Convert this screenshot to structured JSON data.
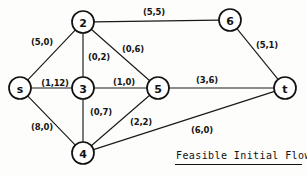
{
  "diagram": {
    "title": "Feasible Initial Flow",
    "caption": "Feasible Initial Flow",
    "nodes": [
      {
        "id": "s",
        "label": "s",
        "x": 20,
        "y": 88,
        "r": 11
      },
      {
        "id": "2",
        "label": "2",
        "x": 83,
        "y": 22,
        "r": 11
      },
      {
        "id": "3",
        "label": "3",
        "x": 83,
        "y": 88,
        "r": 11
      },
      {
        "id": "4",
        "label": "4",
        "x": 83,
        "y": 153,
        "r": 11
      },
      {
        "id": "5",
        "label": "5",
        "x": 158,
        "y": 88,
        "r": 11
      },
      {
        "id": "6",
        "label": "6",
        "x": 230,
        "y": 20,
        "r": 11
      },
      {
        "id": "t",
        "label": "t",
        "x": 285,
        "y": 88,
        "r": 11
      }
    ],
    "edges": [
      {
        "from": "s",
        "to": "2",
        "label": "(5,0)",
        "lx": 42,
        "ly": 42
      },
      {
        "from": "2",
        "to": "6",
        "label": "(5,5)",
        "lx": 154,
        "ly": 12
      },
      {
        "from": "2",
        "to": "3",
        "label": "(0,2)",
        "lx": 99,
        "ly": 57
      },
      {
        "from": "2",
        "to": "5",
        "label": "(0,6)",
        "lx": 133,
        "ly": 49
      },
      {
        "from": "6",
        "to": "t",
        "label": "(5,1)",
        "lx": 267,
        "ly": 45
      },
      {
        "from": "s",
        "to": "3",
        "label": "(1,12)",
        "lx": 55,
        "ly": 83
      },
      {
        "from": "3",
        "to": "5",
        "label": "(1,0)",
        "lx": 124,
        "ly": 82
      },
      {
        "from": "5",
        "to": "t",
        "label": "(3,6)",
        "lx": 207,
        "ly": 80
      },
      {
        "from": "3",
        "to": "4",
        "label": "(0,7)",
        "lx": 101,
        "ly": 112
      },
      {
        "from": "s",
        "to": "4",
        "label": "(8,0)",
        "lx": 42,
        "ly": 127
      },
      {
        "from": "4",
        "to": "5",
        "label": "(2,2)",
        "lx": 141,
        "ly": 122
      },
      {
        "from": "4",
        "to": "t",
        "label": "(6,0)",
        "lx": 202,
        "ly": 130
      }
    ]
  },
  "chart_data": {
    "type": "diagram",
    "title": "Feasible Initial Flow",
    "nodes": [
      "s",
      "2",
      "3",
      "4",
      "5",
      "6",
      "t"
    ],
    "edges": [
      {
        "from": "s",
        "to": "2",
        "flow": 5,
        "capacity": 0,
        "label": "(5,0)"
      },
      {
        "from": "s",
        "to": "3",
        "flow": 1,
        "capacity": 12,
        "label": "(1,12)"
      },
      {
        "from": "s",
        "to": "4",
        "flow": 8,
        "capacity": 0,
        "label": "(8,0)"
      },
      {
        "from": "2",
        "to": "6",
        "flow": 5,
        "capacity": 5,
        "label": "(5,5)"
      },
      {
        "from": "2",
        "to": "3",
        "flow": 0,
        "capacity": 2,
        "label": "(0,2)"
      },
      {
        "from": "2",
        "to": "5",
        "flow": 0,
        "capacity": 6,
        "label": "(0,6)"
      },
      {
        "from": "3",
        "to": "5",
        "flow": 1,
        "capacity": 0,
        "label": "(1,0)"
      },
      {
        "from": "3",
        "to": "4",
        "flow": 0,
        "capacity": 7,
        "label": "(0,7)"
      },
      {
        "from": "4",
        "to": "5",
        "flow": 2,
        "capacity": 2,
        "label": "(2,2)"
      },
      {
        "from": "4",
        "to": "t",
        "flow": 6,
        "capacity": 0,
        "label": "(6,0)"
      },
      {
        "from": "5",
        "to": "t",
        "flow": 3,
        "capacity": 6,
        "label": "(3,6)"
      },
      {
        "from": "6",
        "to": "t",
        "flow": 5,
        "capacity": 1,
        "label": "(5,1)"
      }
    ]
  }
}
